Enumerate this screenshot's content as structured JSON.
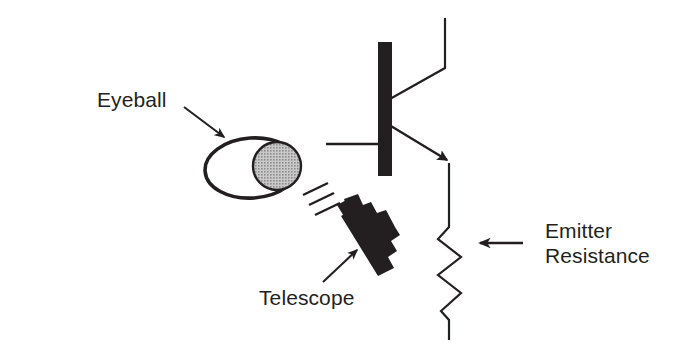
{
  "figure": {
    "kind": "circuit-illustration",
    "title": "",
    "background_color": "#ffffff",
    "ink_color": "#231f20",
    "iris_fill_color": "#a9a9a9"
  },
  "labels": {
    "eyeball": "Eyeball",
    "telescope": "Telescope",
    "emitter_resistance_line1": "Emitter",
    "emitter_resistance_line2": "Resistance"
  },
  "components": [
    {
      "name": "npn-transistor",
      "label": "",
      "parts": [
        "base-bar",
        "base-lead",
        "collector-lead",
        "emitter-lead-with-arrow"
      ]
    },
    {
      "name": "emitter-resistor",
      "label": "Emitter Resistance",
      "shape": "zigzag"
    },
    {
      "name": "eyeball",
      "label": "Eyeball",
      "shape": "ellipse-with-iris-circle"
    },
    {
      "name": "telescope",
      "label": "Telescope",
      "shape": "tapered-barrel-with-body"
    },
    {
      "name": "light-rays",
      "label": "",
      "count": 3
    }
  ],
  "annotations": [
    {
      "name": "eyeball-pointer",
      "target": "eyeball",
      "direction": "down-right"
    },
    {
      "name": "telescope-pointer",
      "target": "telescope",
      "direction": "up-right"
    },
    {
      "name": "emitter-resistance-pointer",
      "target": "emitter-resistor",
      "direction": "left"
    }
  ]
}
